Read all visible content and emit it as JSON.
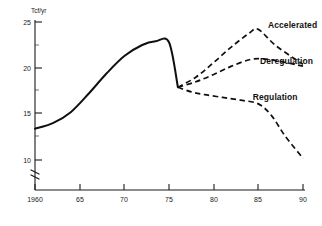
{
  "chart_data": {
    "type": "line",
    "title": "",
    "xlabel": "",
    "ylabel": "Tcf/yr",
    "xlim": [
      1960,
      1990
    ],
    "ylim": [
      9.2,
      25.4
    ],
    "grid": false,
    "legend_position": "inline-right-annotations",
    "axis_break": true,
    "x_ticks": [
      "1960",
      "65",
      "70",
      "75",
      "80",
      "85",
      "90"
    ],
    "x_tick_values": [
      1960,
      1965,
      1970,
      1975,
      1980,
      1985,
      1990
    ],
    "y_ticks": [
      "25",
      "20",
      "15",
      "10"
    ],
    "y_tick_values": [
      25,
      20,
      15,
      10
    ],
    "series": [
      {
        "name": "Historical",
        "style": "solid",
        "label": "",
        "x": [
          1960,
          1962,
          1964,
          1966,
          1968,
          1970,
          1972,
          1973.5,
          1975,
          1976
        ],
        "values": [
          13.4,
          14.0,
          15.2,
          17.2,
          19.4,
          21.3,
          22.5,
          22.9,
          22.8,
          17.9
        ]
      },
      {
        "name": "Accelerated",
        "style": "dashed",
        "label": "Accelerated",
        "x": [
          1976,
          1978,
          1980,
          1982,
          1984,
          1985,
          1987,
          1990
        ],
        "values": [
          17.9,
          19.0,
          20.6,
          22.3,
          23.8,
          24.2,
          22.4,
          20.4
        ]
      },
      {
        "name": "Deregulation",
        "style": "dashed",
        "label": "Deregulation",
        "x": [
          1976,
          1978,
          1980,
          1982,
          1984,
          1985.5,
          1987,
          1990
        ],
        "values": [
          17.9,
          18.5,
          19.3,
          20.2,
          20.9,
          21.0,
          20.8,
          20.2
        ]
      },
      {
        "name": "Regulation",
        "style": "dashed",
        "label": "Regulation",
        "x": [
          1976,
          1977.5,
          1979,
          1981,
          1983,
          1985,
          1986.5,
          1988,
          1990
        ],
        "values": [
          17.9,
          17.4,
          17.1,
          16.8,
          16.5,
          16.1,
          14.8,
          12.6,
          10.2
        ]
      }
    ],
    "annotations": [
      {
        "text": "Accelerated",
        "x": 1986.3,
        "y": 24.6
      },
      {
        "text": "Deregulation",
        "x": 1985.4,
        "y": 20.6
      },
      {
        "text": "Regulation",
        "x": 1984.6,
        "y": 16.7
      }
    ]
  },
  "axis": {
    "y_unit_label": "Tcf/yr"
  }
}
